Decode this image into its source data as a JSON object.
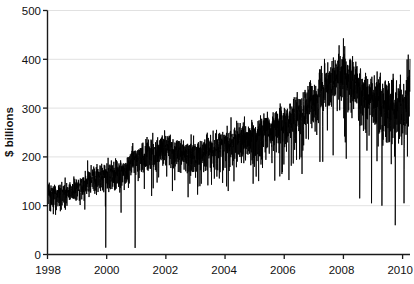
{
  "chart_data": {
    "type": "line",
    "title": "",
    "subtitle": "",
    "xlabel": "",
    "ylabel": "$ billions",
    "xlim": [
      1998.0,
      2010.25
    ],
    "ylim": [
      0,
      500
    ],
    "xticks": [
      1998,
      2000,
      2002,
      2004,
      2006,
      2008,
      2010
    ],
    "xticklabels": [
      "1998",
      "2000",
      "2002",
      "2004",
      "2006",
      "2008",
      "2010"
    ],
    "yticks": [
      0,
      100,
      200,
      300,
      400,
      500
    ],
    "yticklabels": [
      "0",
      "100",
      "200",
      "300",
      "400",
      "500"
    ],
    "grid": "horizontal",
    "legend": "none",
    "series_name": "daily volume",
    "line_color": "#000000",
    "grid_color": "#d9d9d9",
    "axis_color": "#1a1a1a",
    "background": "#ffffff",
    "frequency": "daily (business days)",
    "trend_anchors": [
      {
        "x": 1998.0,
        "y": 125
      },
      {
        "x": 1998.5,
        "y": 130
      },
      {
        "x": 1999.0,
        "y": 140
      },
      {
        "x": 1999.5,
        "y": 160
      },
      {
        "x": 2000.0,
        "y": 168
      },
      {
        "x": 2000.5,
        "y": 175
      },
      {
        "x": 2001.0,
        "y": 205
      },
      {
        "x": 2001.5,
        "y": 215
      },
      {
        "x": 2002.0,
        "y": 225
      },
      {
        "x": 2002.5,
        "y": 215
      },
      {
        "x": 2003.0,
        "y": 210
      },
      {
        "x": 2003.5,
        "y": 218
      },
      {
        "x": 2004.0,
        "y": 230
      },
      {
        "x": 2004.5,
        "y": 240
      },
      {
        "x": 2005.0,
        "y": 250
      },
      {
        "x": 2005.5,
        "y": 262
      },
      {
        "x": 2006.0,
        "y": 272
      },
      {
        "x": 2006.5,
        "y": 295
      },
      {
        "x": 2007.0,
        "y": 330
      },
      {
        "x": 2007.5,
        "y": 360
      },
      {
        "x": 2008.0,
        "y": 385
      },
      {
        "x": 2008.4,
        "y": 360
      },
      {
        "x": 2008.8,
        "y": 330
      },
      {
        "x": 2009.2,
        "y": 320
      },
      {
        "x": 2009.6,
        "y": 315
      },
      {
        "x": 2010.0,
        "y": 320
      },
      {
        "x": 2010.25,
        "y": 345
      }
    ],
    "max_value": 455,
    "min_value": 12,
    "start_value": 118,
    "end_value": 400,
    "noise_amplitude_early": 22,
    "noise_amplitude_late": 55,
    "spike_events": [
      {
        "x": 1999.97,
        "y": 14
      },
      {
        "x": 2000.96,
        "y": 8
      },
      {
        "x": 2001.52,
        "y": 120
      },
      {
        "x": 2002.22,
        "y": 130
      },
      {
        "x": 2003.15,
        "y": 140
      },
      {
        "x": 2004.3,
        "y": 150
      },
      {
        "x": 2004.95,
        "y": 145
      },
      {
        "x": 2005.85,
        "y": 160
      },
      {
        "x": 2006.6,
        "y": 165
      },
      {
        "x": 2007.3,
        "y": 190
      },
      {
        "x": 2008.55,
        "y": 115
      },
      {
        "x": 2008.95,
        "y": 105
      },
      {
        "x": 2009.3,
        "y": 100
      },
      {
        "x": 2009.75,
        "y": 60
      },
      {
        "x": 2010.05,
        "y": 105
      }
    ]
  },
  "axes": {
    "y_axis_title": "$ billions",
    "y_tick_0": "0",
    "y_tick_1": "100",
    "y_tick_2": "200",
    "y_tick_3": "300",
    "y_tick_4": "400",
    "y_tick_5": "500",
    "x_tick_0": "1998",
    "x_tick_1": "2000",
    "x_tick_2": "2002",
    "x_tick_3": "2004",
    "x_tick_4": "2006",
    "x_tick_5": "2008",
    "x_tick_6": "2010"
  }
}
